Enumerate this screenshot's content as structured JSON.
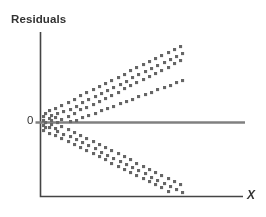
{
  "chart_data": {
    "type": "scatter",
    "title": "",
    "subtitle": "",
    "xlabel": "X",
    "ylabel": "Residuals",
    "annotations": [
      "0"
    ],
    "grid": false,
    "legend": null,
    "xlim": [
      0,
      100
    ],
    "ylim": [
      -100,
      100
    ],
    "reference_lines": [
      {
        "orientation": "horizontal",
        "value": 0,
        "label": "0",
        "color": "#808080"
      }
    ],
    "pattern": "fan-shaped / megaphone — residual spread increases with X (heteroscedasticity)",
    "series": [
      {
        "name": "residuals",
        "color": "#666666",
        "marker": "square",
        "points": [
          [
            1,
            3
          ],
          [
            1,
            -4
          ],
          [
            1,
            8
          ],
          [
            1,
            -10
          ],
          [
            2,
            0
          ],
          [
            2,
            12
          ],
          [
            2,
            -7
          ],
          [
            4,
            5
          ],
          [
            4,
            -6
          ],
          [
            4,
            15
          ],
          [
            4,
            -14
          ],
          [
            5,
            2
          ],
          [
            5,
            -2
          ],
          [
            5,
            9
          ],
          [
            7,
            18
          ],
          [
            7,
            -17
          ],
          [
            7,
            6
          ],
          [
            7,
            -8
          ],
          [
            8,
            0
          ],
          [
            8,
            11
          ],
          [
            8,
            -12
          ],
          [
            10,
            22
          ],
          [
            10,
            -20
          ],
          [
            10,
            4
          ],
          [
            10,
            -5
          ],
          [
            11,
            14
          ],
          [
            11,
            -15
          ],
          [
            13,
            26
          ],
          [
            13,
            -24
          ],
          [
            13,
            8
          ],
          [
            13,
            -9
          ],
          [
            14,
            17
          ],
          [
            14,
            -18
          ],
          [
            14,
            1
          ],
          [
            16,
            30
          ],
          [
            16,
            -28
          ],
          [
            16,
            12
          ],
          [
            16,
            -13
          ],
          [
            17,
            21
          ],
          [
            17,
            -22
          ],
          [
            17,
            3
          ],
          [
            19,
            34
          ],
          [
            19,
            -32
          ],
          [
            19,
            16
          ],
          [
            19,
            -17
          ],
          [
            20,
            25
          ],
          [
            20,
            -26
          ],
          [
            20,
            6
          ],
          [
            22,
            38
          ],
          [
            22,
            -36
          ],
          [
            22,
            19
          ],
          [
            22,
            -20
          ],
          [
            23,
            29
          ],
          [
            23,
            -30
          ],
          [
            23,
            9
          ],
          [
            25,
            42
          ],
          [
            25,
            -40
          ],
          [
            25,
            23
          ],
          [
            25,
            -24
          ],
          [
            26,
            33
          ],
          [
            26,
            -34
          ],
          [
            26,
            12
          ],
          [
            28,
            46
          ],
          [
            28,
            -44
          ],
          [
            28,
            27
          ],
          [
            28,
            -28
          ],
          [
            29,
            37
          ],
          [
            29,
            -38
          ],
          [
            29,
            15
          ],
          [
            31,
            50
          ],
          [
            31,
            -48
          ],
          [
            31,
            31
          ],
          [
            31,
            -32
          ],
          [
            32,
            41
          ],
          [
            32,
            -42
          ],
          [
            32,
            18
          ],
          [
            34,
            54
          ],
          [
            34,
            -52
          ],
          [
            34,
            35
          ],
          [
            34,
            -36
          ],
          [
            35,
            45
          ],
          [
            35,
            -46
          ],
          [
            35,
            21
          ],
          [
            37,
            58
          ],
          [
            37,
            -56
          ],
          [
            37,
            39
          ],
          [
            37,
            -40
          ],
          [
            38,
            49
          ],
          [
            38,
            -50
          ],
          [
            38,
            24
          ],
          [
            40,
            62
          ],
          [
            40,
            -60
          ],
          [
            40,
            43
          ],
          [
            40,
            -44
          ],
          [
            41,
            53
          ],
          [
            41,
            -54
          ],
          [
            41,
            27
          ],
          [
            43,
            66
          ],
          [
            43,
            -64
          ],
          [
            43,
            47
          ],
          [
            43,
            -48
          ],
          [
            44,
            57
          ],
          [
            44,
            -58
          ],
          [
            44,
            30
          ],
          [
            46,
            70
          ],
          [
            46,
            -68
          ],
          [
            46,
            51
          ],
          [
            46,
            -52
          ],
          [
            47,
            61
          ],
          [
            47,
            -62
          ],
          [
            47,
            33
          ],
          [
            49,
            74
          ],
          [
            49,
            -72
          ],
          [
            49,
            55
          ],
          [
            49,
            -56
          ],
          [
            50,
            65
          ],
          [
            50,
            -66
          ],
          [
            50,
            36
          ],
          [
            52,
            78
          ],
          [
            52,
            -76
          ],
          [
            52,
            59
          ],
          [
            52,
            -60
          ],
          [
            53,
            69
          ],
          [
            53,
            -70
          ],
          [
            53,
            39
          ],
          [
            55,
            82
          ],
          [
            55,
            -80
          ],
          [
            55,
            63
          ],
          [
            55,
            -64
          ],
          [
            56,
            73
          ],
          [
            56,
            -74
          ],
          [
            56,
            42
          ],
          [
            58,
            86
          ],
          [
            58,
            -84
          ],
          [
            58,
            67
          ],
          [
            58,
            -68
          ],
          [
            59,
            77
          ],
          [
            59,
            -78
          ],
          [
            59,
            45
          ],
          [
            61,
            90
          ],
          [
            61,
            -88
          ],
          [
            61,
            71
          ],
          [
            61,
            -72
          ],
          [
            62,
            81
          ],
          [
            62,
            -82
          ],
          [
            62,
            48
          ],
          [
            64,
            94
          ],
          [
            64,
            -92
          ],
          [
            64,
            75
          ],
          [
            64,
            -76
          ],
          [
            65,
            85
          ],
          [
            65,
            -86
          ],
          [
            65,
            51
          ],
          [
            67,
            97
          ],
          [
            67,
            -95
          ],
          [
            67,
            79
          ],
          [
            67,
            -80
          ],
          [
            68,
            89
          ],
          [
            68,
            -90
          ],
          [
            68,
            54
          ]
        ]
      }
    ]
  },
  "figure": {
    "ylabel": "Residuals",
    "xlabel": "X",
    "zero_label": "0",
    "colors": {
      "point": "#666666",
      "axis": "#444444",
      "zero_line": "#808080",
      "background": "#ffffff",
      "text": "#333333"
    }
  }
}
